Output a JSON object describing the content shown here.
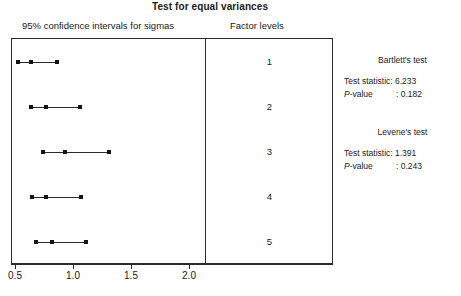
{
  "title": "Test for equal variances",
  "headers": {
    "left": "95% confidence intervals for sigmas",
    "right": "Factor levels"
  },
  "axis": {
    "ticks": [
      "0.5",
      "1.0",
      "1.5",
      "2.0"
    ],
    "tick_values": [
      0.5,
      1.0,
      1.5,
      2.0
    ],
    "min": 0.5,
    "max": 2.15
  },
  "levels": [
    "1",
    "2",
    "3",
    "4",
    "5"
  ],
  "results": [
    {
      "name": "Bartlett's test",
      "stat_label": "Test statistic:",
      "stat_value": "6.233",
      "p_label": "P",
      "p_label_rest": "-value",
      "p_sep": ":",
      "p_value": "0.182"
    },
    {
      "name": "Levene's test",
      "stat_label": "Test statistic:",
      "stat_value": "1.391",
      "p_label": "P",
      "p_label_rest": "-value",
      "p_sep": ":",
      "p_value": "0.243"
    }
  ],
  "colors": {
    "line": "#2b2b2b",
    "marker": "#141414",
    "text": "#1a1a1a",
    "background": "#ffffff"
  },
  "chart_data": {
    "type": "line",
    "title": "Test for equal variances",
    "xlabel": "95% confidence intervals for sigmas",
    "ylabel": "Factor levels",
    "xlim": [
      0.5,
      2.15
    ],
    "grid": false,
    "legend": null,
    "categories": [
      "1",
      "2",
      "3",
      "4",
      "5"
    ],
    "series": [
      {
        "name": "95% CI for sigma",
        "intervals": [
          {
            "level": "1",
            "lower": 0.52,
            "center": 0.63,
            "upper": 0.85
          },
          {
            "level": "2",
            "lower": 0.63,
            "center": 0.76,
            "upper": 1.05
          },
          {
            "level": "3",
            "lower": 0.73,
            "center": 0.92,
            "upper": 1.3
          },
          {
            "level": "4",
            "lower": 0.64,
            "center": 0.76,
            "upper": 1.06
          },
          {
            "level": "5",
            "lower": 0.67,
            "center": 0.81,
            "upper": 1.1
          }
        ]
      }
    ],
    "annotations": [
      "Bartlett's test  Test statistic: 6.233  P-value : 0.182",
      "Levene's test  Test statistic: 1.391  P-value : 0.243"
    ]
  }
}
